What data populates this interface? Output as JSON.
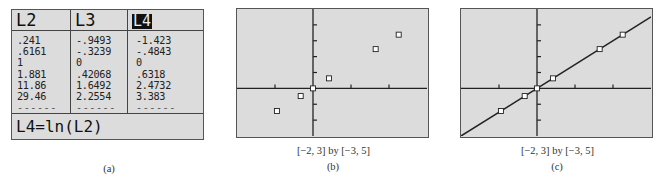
{
  "panel_a": {
    "columns": [
      {
        "header": "L2",
        "highlighted": false,
        "values": [
          ".241",
          ".6161",
          "1",
          "1.881",
          "11.86",
          "29.46"
        ],
        "placeholder": "------"
      },
      {
        "header": "L3",
        "highlighted": false,
        "values": [
          "-.9493",
          "-.3239",
          "0",
          ".42068",
          "1.6492",
          "2.2554"
        ],
        "placeholder": "------"
      },
      {
        "header": "L4",
        "highlighted": true,
        "values": [
          "-1.423",
          "-.4843",
          "0",
          ".6318",
          "2.4732",
          "3.383"
        ],
        "placeholder": "------"
      }
    ],
    "formula": "L4=ln(L2)",
    "caption": "(a)"
  },
  "panel_b": {
    "window": "[−2, 3] by [−3, 5]",
    "caption": "(b)"
  },
  "panel_c": {
    "window": "[−2, 3] by [−3, 5]",
    "caption": "(c)"
  },
  "colors": {
    "screen_bg": "#dcdcdc",
    "ink": "#222222",
    "marker_fill": "#ffffff"
  },
  "chart_data": [
    {
      "type": "table",
      "title": "(a)",
      "columns": [
        "L2",
        "L3",
        "L4"
      ],
      "rows": [
        [
          ".241",
          "-.9493",
          "-1.423"
        ],
        [
          ".6161",
          "-.3239",
          "-.4843"
        ],
        [
          "1",
          "0",
          "0"
        ],
        [
          "1.881",
          ".42068",
          ".6318"
        ],
        [
          "11.86",
          "1.6492",
          "2.4732"
        ],
        [
          "29.46",
          "2.2554",
          "3.383"
        ]
      ],
      "footer": "L4=ln(L2)"
    },
    {
      "type": "scatter",
      "title": "(b)",
      "subtitle": "[-2, 3] by [-3, 5]",
      "x": [
        -0.9493,
        -0.3239,
        0,
        0.42068,
        1.6492,
        2.2554
      ],
      "y": [
        -1.423,
        -0.4843,
        0,
        0.6318,
        2.4732,
        3.383
      ],
      "xlim": [
        -2,
        3
      ],
      "ylim": [
        -3,
        5
      ],
      "xticks": [
        -1,
        1,
        2
      ],
      "yticks": [
        -2,
        -1,
        1,
        2,
        3,
        4
      ],
      "marker": "hollow-square",
      "grid": false
    },
    {
      "type": "scatter",
      "title": "(c)",
      "subtitle": "[-2, 3] by [-3, 5]",
      "x": [
        -0.9493,
        -0.3239,
        0,
        0.42068,
        1.6492,
        2.2554
      ],
      "y": [
        -1.423,
        -0.4843,
        0,
        0.6318,
        2.4732,
        3.383
      ],
      "xlim": [
        -2,
        3
      ],
      "ylim": [
        -3,
        5
      ],
      "xticks": [
        -1,
        1,
        2
      ],
      "yticks": [
        -2,
        -1,
        1,
        2,
        3,
        4
      ],
      "marker": "hollow-square",
      "grid": false,
      "fit_line": {
        "slope": 1.5,
        "intercept": 0
      }
    }
  ]
}
